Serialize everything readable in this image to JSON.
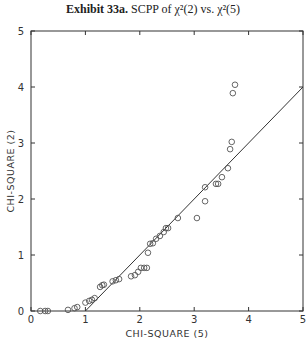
{
  "title_bold": "Exhibit 33a.",
  "title_rest": "SCPP of χ²(2) vs. χ²(5)",
  "chart_data": {
    "type": "scatter",
    "title": "Exhibit 33a. SCPP of χ²(2) vs. χ²(5)",
    "xlabel": "CHI-SQUARE (5)",
    "ylabel": "CHI-SQUARE (2)",
    "xlim": [
      0,
      5
    ],
    "ylim": [
      0,
      5
    ],
    "xticks": [
      0,
      1,
      2,
      3,
      4,
      5
    ],
    "yticks": [
      0,
      1,
      2,
      3,
      4,
      5
    ],
    "grid": false,
    "reference_line": {
      "x": [
        1,
        5
      ],
      "y": [
        0,
        4
      ]
    },
    "series": [
      {
        "name": "points",
        "marker": "open-circle",
        "x": [
          0.17,
          0.26,
          0.31,
          0.68,
          0.8,
          0.85,
          1.0,
          1.07,
          1.12,
          1.17,
          1.27,
          1.31,
          1.34,
          1.5,
          1.56,
          1.62,
          1.84,
          1.91,
          1.97,
          2.02,
          2.08,
          2.13,
          2.15,
          2.19,
          2.24,
          2.3,
          2.37,
          2.44,
          2.48,
          2.52,
          2.7,
          3.05,
          3.2,
          3.2,
          3.4,
          3.44,
          3.51,
          3.62,
          3.66,
          3.69,
          3.71,
          3.75
        ],
        "y": [
          0,
          0,
          0,
          0.02,
          0.05,
          0.07,
          0.15,
          0.18,
          0.2,
          0.23,
          0.43,
          0.46,
          0.47,
          0.53,
          0.55,
          0.57,
          0.62,
          0.64,
          0.7,
          0.77,
          0.77,
          0.77,
          1.04,
          1.2,
          1.21,
          1.29,
          1.34,
          1.41,
          1.48,
          1.48,
          1.66,
          1.66,
          1.96,
          2.21,
          2.27,
          2.27,
          2.39,
          2.55,
          2.89,
          3.02,
          3.89,
          4.04
        ]
      }
    ]
  }
}
